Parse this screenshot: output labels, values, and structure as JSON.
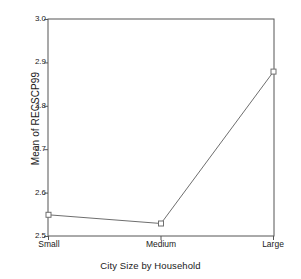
{
  "chart_data": {
    "type": "line",
    "title": "",
    "xlabel": "City Size by Household",
    "ylabel": "Mean of RECSCP99",
    "categories": [
      "Small",
      "Medium",
      "Large"
    ],
    "values": [
      2.55,
      2.53,
      2.88
    ],
    "series": [
      {
        "name": "Mean of RECSCP99",
        "values": [
          2.55,
          2.53,
          2.88
        ]
      }
    ],
    "ylim": [
      2.5,
      3.0
    ],
    "yticks": [
      "2.5",
      "2.6",
      "2.7",
      "2.8",
      "2.9",
      "3.0"
    ],
    "ytick_values": [
      2.5,
      2.6,
      2.7,
      2.8,
      2.9,
      3.0
    ],
    "xticks": [
      "Small",
      "Medium",
      "Large"
    ],
    "grid": false,
    "legend": "none",
    "marker": "open-square",
    "line_color": "#6e6e6e",
    "axis_color": "#4a4a4a",
    "background": "#ffffff"
  },
  "axes": {
    "y_title": "Mean of RECSCP99",
    "x_title": "City Size by Household",
    "y_labels": [
      "3.0",
      "2.9",
      "2.8",
      "2.7",
      "2.6",
      "2.5"
    ],
    "x_labels": [
      "Small",
      "Medium",
      "Large"
    ]
  }
}
